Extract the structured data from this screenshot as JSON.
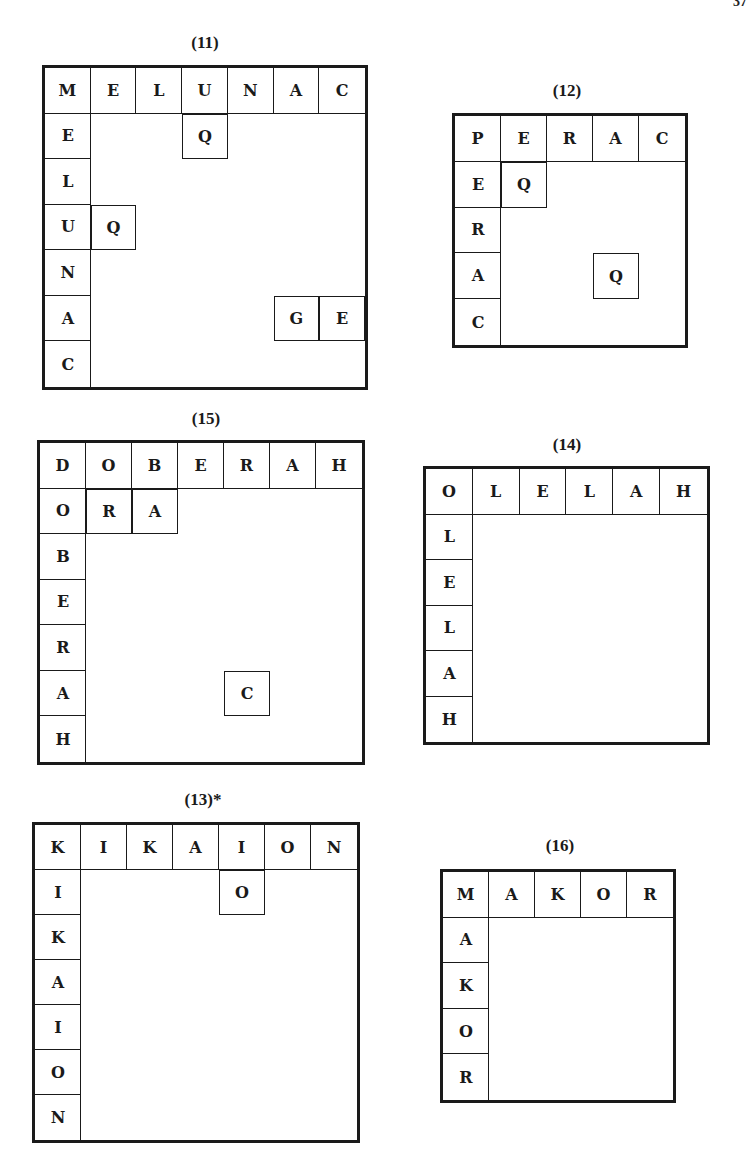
{
  "page": {
    "number_fragment": "37"
  },
  "puzzles": [
    {
      "id": "11",
      "label": "(11)",
      "word": "MELUNAC",
      "top": [
        "M",
        "E",
        "L",
        "U",
        "N",
        "A",
        "C"
      ],
      "left": [
        "E",
        "L",
        "U",
        "N",
        "A",
        "C"
      ],
      "fills": [
        {
          "row": 1,
          "col": 3,
          "letter": "Q"
        },
        {
          "row": 3,
          "col": 1,
          "letter": "Q"
        },
        {
          "row": 5,
          "col": 5,
          "letter": "G"
        },
        {
          "row": 5,
          "col": 6,
          "letter": "E"
        }
      ],
      "box": {
        "x": 42,
        "y": 65,
        "w": 326,
        "h": 325
      },
      "label_pos": {
        "x": 165,
        "y": 33
      }
    },
    {
      "id": "12",
      "label": "(12)",
      "word": "PERAC",
      "top": [
        "P",
        "E",
        "R",
        "A",
        "C"
      ],
      "left": [
        "E",
        "R",
        "A",
        "C"
      ],
      "fills": [
        {
          "row": 1,
          "col": 1,
          "letter": "Q"
        },
        {
          "row": 3,
          "col": 3,
          "letter": "Q"
        }
      ],
      "box": {
        "x": 452,
        "y": 113,
        "w": 236,
        "h": 235
      },
      "label_pos": {
        "x": 527,
        "y": 81
      }
    },
    {
      "id": "15",
      "label": "(15)",
      "word": "DOBERAH",
      "top": [
        "D",
        "O",
        "B",
        "E",
        "R",
        "A",
        "H"
      ],
      "left": [
        "O",
        "B",
        "E",
        "R",
        "A",
        "H"
      ],
      "fills": [
        {
          "row": 1,
          "col": 1,
          "letter": "R"
        },
        {
          "row": 1,
          "col": 2,
          "letter": "A"
        },
        {
          "row": 5,
          "col": 4,
          "letter": "C"
        }
      ],
      "box": {
        "x": 37,
        "y": 440,
        "w": 328,
        "h": 325
      },
      "label_pos": {
        "x": 166,
        "y": 409
      }
    },
    {
      "id": "14",
      "label": "(14)",
      "word": "OLELAH",
      "top": [
        "O",
        "L",
        "E",
        "L",
        "A",
        "H"
      ],
      "left": [
        "L",
        "E",
        "L",
        "A",
        "H"
      ],
      "fills": [],
      "box": {
        "x": 423,
        "y": 466,
        "w": 287,
        "h": 279
      },
      "label_pos": {
        "x": 527,
        "y": 435
      }
    },
    {
      "id": "13",
      "label": "(13)*",
      "word": "KIKAION",
      "top": [
        "K",
        "I",
        "K",
        "A",
        "I",
        "O",
        "N"
      ],
      "left": [
        "I",
        "K",
        "A",
        "I",
        "O",
        "N"
      ],
      "fills": [
        {
          "row": 1,
          "col": 4,
          "letter": "O"
        }
      ],
      "box": {
        "x": 32,
        "y": 822,
        "w": 328,
        "h": 321
      },
      "label_pos": {
        "x": 163,
        "y": 790
      }
    },
    {
      "id": "16",
      "label": "(16)",
      "word": "MAKOR",
      "top": [
        "M",
        "A",
        "K",
        "O",
        "R"
      ],
      "left": [
        "A",
        "K",
        "O",
        "R"
      ],
      "fills": [],
      "box": {
        "x": 440,
        "y": 869,
        "w": 236,
        "h": 234
      },
      "label_pos": {
        "x": 520,
        "y": 836
      }
    }
  ]
}
